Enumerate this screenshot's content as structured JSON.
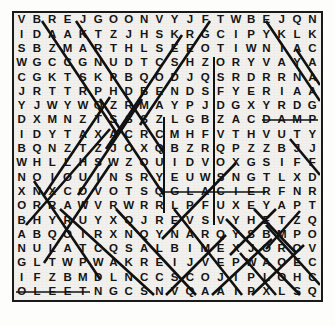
{
  "puzzle": {
    "type": "word-search",
    "rows": 20,
    "cols": 20,
    "grid": [
      "V B R E J G O O N V Y J F T W B E J Q N",
      "I D A A K T Z J H S K R G C I P Y K L K",
      "S B Z M A R T H L S E E O T I W N I A C",
      "W G C C G N U D T C S H Z O R Y V A Y A",
      "C G K T S K P B Q O D J Q S R D R R N A",
      "J R T T R P H D B E N D S F Y E R I A A",
      "Y J W Y W Q Z R M A Y P J D G X Y R D G",
      "D X M N Z T S S S Z L G B Z A C D A M P",
      "I D Y T A X A C R C M H F V T H V U T Y",
      "B Q N Z T Z J O X Q B Z R Q P Z Z B J J",
      "W H L L H S W Z O U I D V O X G S I F F",
      "N O I O U I N S R Y E U W S N G T L X D",
      "X N X C O V O T S Q G L A C I E R F N R",
      "O R R A W V R W R R L P F U X E Y A P T",
      "B H Y R U Y X Q J R E V S V Y H E T Z Q",
      "A B Q O I R X N Q Y N A R Q Y S B M P O",
      "N U L A T C Q S A L B I M E X J O R O V",
      "G L T W P W A K R E I J V E P W A O E C",
      "I F Z B M D L N C C S C O J I P L O H C",
      "O L E E T N G C S N V Q A A I P X L S Q"
    ],
    "found_words": [
      {
        "word": "DAMP",
        "row": 8,
        "start_col": 17,
        "end_col": 20,
        "direction": "horizontal"
      },
      {
        "word": "GLACIER",
        "row": 13,
        "start_col": 11,
        "end_col": 17,
        "direction": "horizontal"
      },
      {
        "word": "FLEET",
        "row": 20,
        "start_col": 1,
        "end_col": 5,
        "direction": "horizontal"
      }
    ],
    "colors": {
      "ink": "#151515",
      "border": "#1a1a1a",
      "paper": "#f2f1ee",
      "mark": "#111111"
    }
  }
}
